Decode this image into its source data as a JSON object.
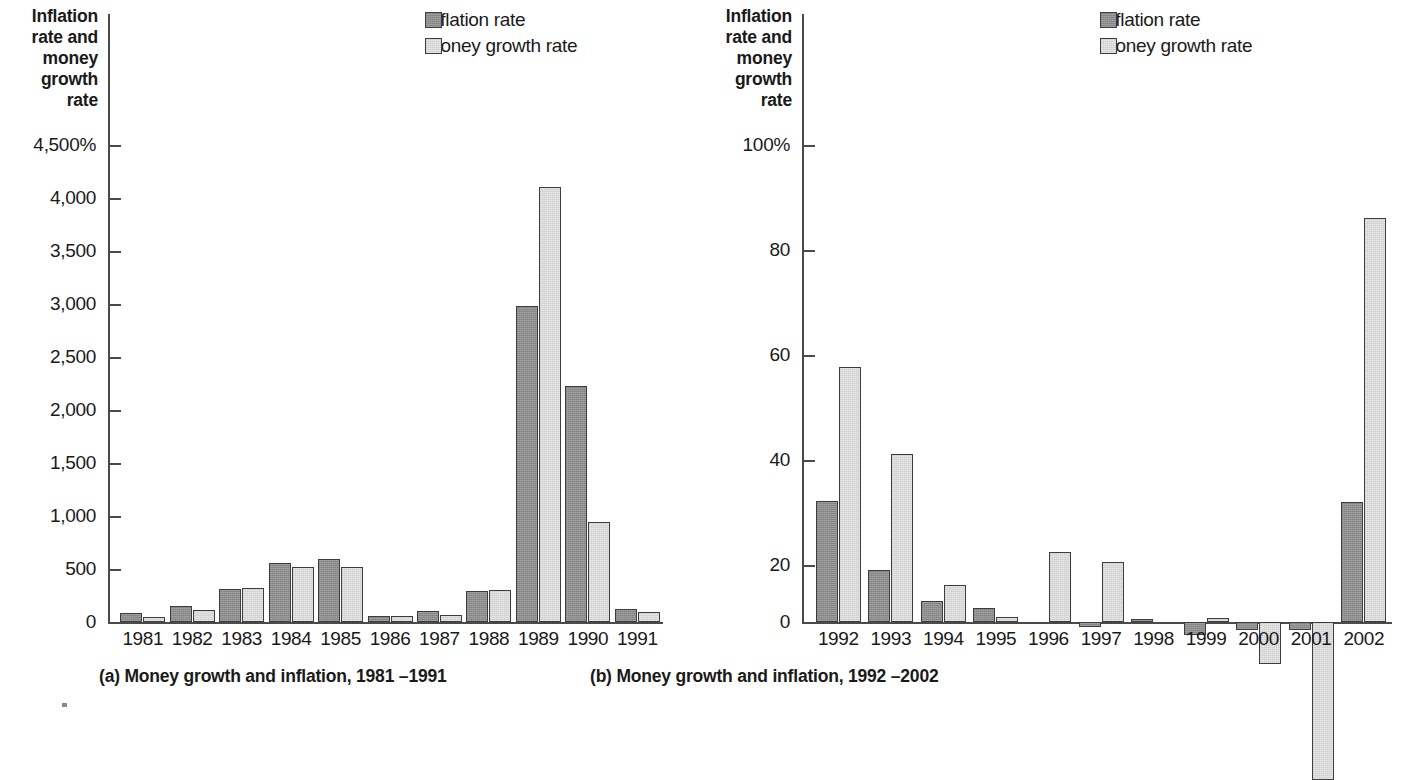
{
  "figure": {
    "legend": {
      "inflation_label": "Inflation rate",
      "money_label": "Money growth rate",
      "inflation_color": "#8c8c8c",
      "money_color": "#d9d9d9"
    }
  },
  "chart_data": [
    {
      "type": "bar",
      "id": "panel-a",
      "title": "(a) Money growth and inflation, 1981 –1991",
      "ylabel": "Inflation rate and money growth rate",
      "ylabel_lines": [
        "Inflation",
        "rate and",
        "money",
        "growth",
        "rate"
      ],
      "xlabel": "",
      "ylim": [
        0,
        4500
      ],
      "ytick_labels": [
        "4,500%",
        "4,000",
        "3,500",
        "3,000",
        "2,500",
        "2,000",
        "1,500",
        "1,000",
        "500",
        "0"
      ],
      "ytick_values": [
        4500,
        4000,
        3500,
        3000,
        2500,
        2000,
        1500,
        1000,
        500,
        0
      ],
      "grid": false,
      "legend_position": "top-right",
      "categories": [
        "1981",
        "1982",
        "1983",
        "1984",
        "1985",
        "1986",
        "1987",
        "1988",
        "1989",
        "1990",
        "1991"
      ],
      "series": [
        {
          "name": "Inflation rate",
          "color": "#8c8c8c",
          "values": [
            85,
            150,
            310,
            560,
            595,
            55,
            100,
            290,
            2980,
            2230,
            125
          ]
        },
        {
          "name": "Money growth rate",
          "color": "#d9d9d9",
          "values": [
            45,
            110,
            320,
            520,
            520,
            55,
            70,
            300,
            4100,
            945,
            90
          ]
        }
      ]
    },
    {
      "type": "bar",
      "id": "panel-b",
      "title": "(b) Money growth and inflation, 1992 –2002",
      "ylabel": "Inflation rate and money growth rate",
      "ylabel_lines": [
        "Inflation",
        "rate and",
        "money",
        "growth",
        "rate"
      ],
      "xlabel": "",
      "ylim": [
        -35,
        100
      ],
      "ytick_labels": [
        "100%",
        "80",
        "60",
        "40",
        "20",
        "0"
      ],
      "ytick_values": [
        100,
        80,
        60,
        40,
        20,
        0
      ],
      "grid": false,
      "legend_position": "top-right",
      "categories": [
        "1992",
        "1993",
        "1994",
        "1995",
        "1996",
        "1997",
        "1998",
        "1999",
        "2000",
        "2001",
        "2002"
      ],
      "series": [
        {
          "name": "Inflation rate",
          "color": "#8c8c8c",
          "values": [
            23,
            10,
            4,
            2.7,
            0,
            -1,
            0.5,
            -2.5,
            -1.5,
            -1.5,
            22.8
          ]
        },
        {
          "name": "Money growth rate",
          "color": "#d9d9d9",
          "values": [
            48.5,
            32,
            7,
            1,
            13.3,
            11.5,
            0,
            0.7,
            -8,
            -30,
            77
          ]
        }
      ]
    }
  ]
}
